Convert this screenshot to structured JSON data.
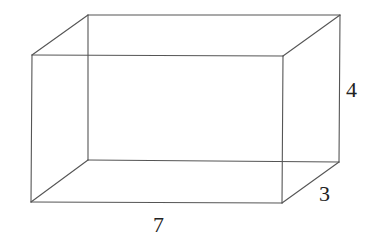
{
  "figure": {
    "type": "rectangular prism (wireframe)",
    "dimensions": {
      "length": "7",
      "width": "3",
      "height": "4"
    },
    "labels": [
      {
        "id": "height",
        "text": "4",
        "x": 346,
        "y": 97
      },
      {
        "id": "depth",
        "text": "3",
        "x": 319,
        "y": 201
      },
      {
        "id": "length",
        "text": "7",
        "x": 153,
        "y": 232
      }
    ],
    "vertices": {
      "front_top_left": [
        32,
        55
      ],
      "front_top_right": [
        283,
        56
      ],
      "front_bottom_left": [
        31,
        202
      ],
      "front_bottom_right": [
        282,
        203
      ],
      "back_top_left": [
        88,
        15
      ],
      "back_top_right": [
        340,
        15
      ],
      "back_bottom_left": [
        88,
        160
      ],
      "back_bottom_right": [
        339,
        162
      ]
    },
    "edges": [
      [
        "front_top_left",
        "front_top_right"
      ],
      [
        "front_top_right",
        "front_bottom_right"
      ],
      [
        "front_bottom_right",
        "front_bottom_left"
      ],
      [
        "front_bottom_left",
        "front_top_left"
      ],
      [
        "back_top_left",
        "back_top_right"
      ],
      [
        "back_top_right",
        "back_bottom_right"
      ],
      [
        "back_bottom_right",
        "back_bottom_left"
      ],
      [
        "back_bottom_left",
        "back_top_left"
      ],
      [
        "front_top_left",
        "back_top_left"
      ],
      [
        "front_top_right",
        "back_top_right"
      ],
      [
        "front_bottom_left",
        "back_bottom_left"
      ],
      [
        "front_bottom_right",
        "back_bottom_right"
      ]
    ],
    "colors": {
      "edge": "#555555",
      "label": "#222222",
      "background": "#ffffff"
    }
  }
}
